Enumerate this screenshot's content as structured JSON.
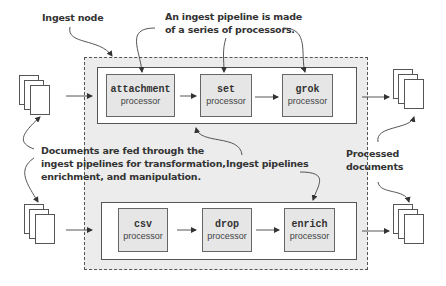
{
  "diagram": {
    "labels": {
      "ingest_node": "Ingest node",
      "pipeline_made_line1": "An ingest pipeline is made",
      "pipeline_made_line2": "of a series of processors.",
      "documents_fed_line1": "Documents are fed through the",
      "documents_fed_line2": "ingest pipelines for transformation,",
      "documents_fed_line3": "enrichment, and manipulation.",
      "ingest_pipelines": "Ingest pipelines",
      "processed_line1": "Processed",
      "processed_line2": "documents"
    },
    "pipelines": [
      {
        "name": "top-pipeline",
        "processors": [
          {
            "name": "attachment",
            "sub": "processor"
          },
          {
            "name": "set",
            "sub": "processor"
          },
          {
            "name": "grok",
            "sub": "processor"
          }
        ]
      },
      {
        "name": "bottom-pipeline",
        "processors": [
          {
            "name": "csv",
            "sub": "processor"
          },
          {
            "name": "drop",
            "sub": "processor"
          },
          {
            "name": "enrich",
            "sub": "processor"
          }
        ]
      }
    ],
    "colors": {
      "node_fill": "#ececec",
      "processor_fill": "#e6e6e6",
      "stroke": "#555555",
      "text": "#333333"
    }
  }
}
